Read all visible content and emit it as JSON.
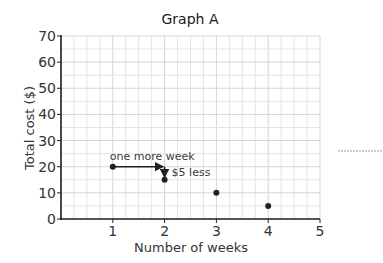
{
  "chart_data": {
    "type": "scatter",
    "title": "Graph A",
    "xlabel": "Number of weeks",
    "ylabel": "Total cost ($)",
    "xlim": [
      0,
      5
    ],
    "ylim": [
      0,
      70
    ],
    "x_ticks": [
      "1",
      "2",
      "3",
      "4",
      "5"
    ],
    "y_ticks": [
      "0",
      "10",
      "20",
      "30",
      "40",
      "50",
      "60",
      "70"
    ],
    "grid": true,
    "series": [
      {
        "name": "Total cost",
        "points": [
          {
            "x": 1,
            "y": 20
          },
          {
            "x": 2,
            "y": 15
          },
          {
            "x": 3,
            "y": 10
          },
          {
            "x": 4,
            "y": 5
          }
        ]
      }
    ],
    "annotations": [
      {
        "text": "one more week",
        "from": {
          "x": 1,
          "y": 20
        },
        "to": {
          "x": 2,
          "y": 20
        }
      },
      {
        "text": "$5 less",
        "from": {
          "x": 2,
          "y": 20
        },
        "to": {
          "x": 2,
          "y": 15
        }
      }
    ],
    "colors": {
      "point": "#222222",
      "axis": "#222222",
      "grid": "#e4e4e4",
      "grid_major": "#d6d6d6"
    }
  }
}
